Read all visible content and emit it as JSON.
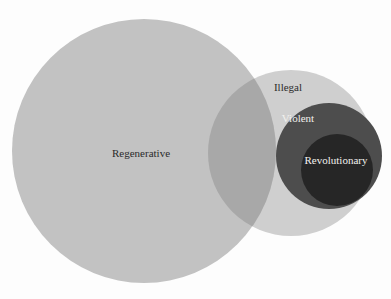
{
  "diagram": {
    "type": "euler-venn",
    "title": "",
    "background_color": "#fdfdfd",
    "sets": [
      {
        "id": "regenerative",
        "label": "Regenerative",
        "fill_color": "#c2c2c2",
        "label_color": "#2b2b2b",
        "center_x": 144,
        "center_y": 151,
        "radius": 132,
        "label_x": 141,
        "label_y": 154,
        "font_size": 11
      },
      {
        "id": "illegal",
        "label": "Illegal",
        "fill_color": "#cfcfcf",
        "label_color": "#2b2b2b",
        "center_x": 291,
        "center_y": 153,
        "radius": 83,
        "label_x": 288,
        "label_y": 88,
        "font_size": 11
      },
      {
        "id": "violent",
        "label": "Violent",
        "fill_color": "#4d4d4d",
        "label_color": "#f2f1ee",
        "center_x": 329,
        "center_y": 156,
        "radius": 53,
        "label_x": 298,
        "label_y": 119,
        "font_size": 11
      },
      {
        "id": "revolutionary",
        "label": "Revolutionary",
        "fill_color": "#262626",
        "label_color": "#f2f1ee",
        "center_x": 337,
        "center_y": 170,
        "radius": 36,
        "label_x": 336,
        "label_y": 161,
        "font_size": 11
      }
    ],
    "overlap_regions": [
      {
        "id": "regenerative-illegal-overlap",
        "sets": [
          "regenerative",
          "illegal"
        ],
        "fill_color": "#a8a8a8"
      }
    ]
  }
}
